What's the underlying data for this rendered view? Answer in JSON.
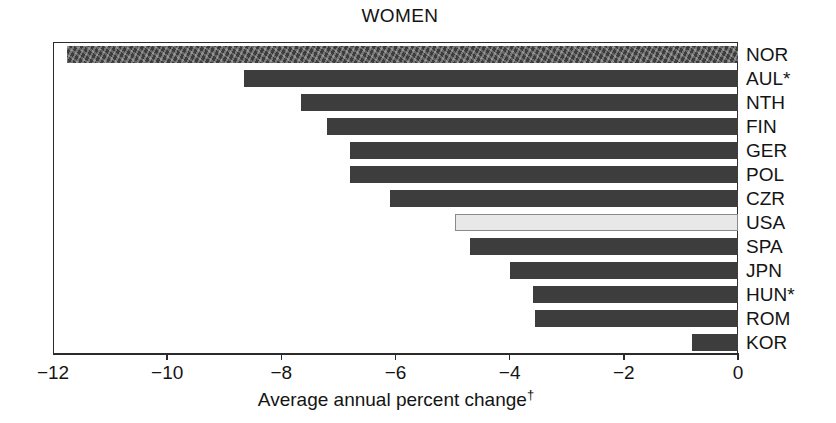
{
  "chart_data": {
    "type": "bar",
    "orientation": "horizontal",
    "title": "WOMEN",
    "xlabel": "Average annual percent change",
    "xlabel_superscript": "†",
    "ylabel": "",
    "xlim": [
      -12,
      0
    ],
    "xticks": [
      -12,
      -10,
      -8,
      -6,
      -4,
      -2,
      0
    ],
    "xtick_labels": [
      "−12",
      "−10",
      "−8",
      "−6",
      "−4",
      "−2",
      "0"
    ],
    "grid": false,
    "legend": null,
    "categories": [
      "NOR",
      "AUL*",
      "NTH",
      "FIN",
      "GER",
      "POL",
      "CZR",
      "USA",
      "SPA",
      "JPN",
      "HUN*",
      "ROM",
      "KOR"
    ],
    "values": [
      -11.75,
      -8.65,
      -7.65,
      -7.2,
      -6.8,
      -6.8,
      -6.1,
      -4.95,
      -4.7,
      -4.0,
      -3.6,
      -3.55,
      -0.8
    ],
    "highlight_category": "USA",
    "bars": [
      {
        "label": "NOR",
        "value": -11.75,
        "style": "mottled"
      },
      {
        "label": "AUL*",
        "value": -8.65,
        "style": "solid"
      },
      {
        "label": "NTH",
        "value": -7.65,
        "style": "solid"
      },
      {
        "label": "FIN",
        "value": -7.2,
        "style": "solid"
      },
      {
        "label": "GER",
        "value": -6.8,
        "style": "solid"
      },
      {
        "label": "POL",
        "value": -6.8,
        "style": "solid"
      },
      {
        "label": "CZR",
        "value": -6.1,
        "style": "solid"
      },
      {
        "label": "USA",
        "value": -4.95,
        "style": "highlight"
      },
      {
        "label": "SPA",
        "value": -4.7,
        "style": "solid"
      },
      {
        "label": "JPN",
        "value": -4.0,
        "style": "solid"
      },
      {
        "label": "HUN*",
        "value": -3.6,
        "style": "solid"
      },
      {
        "label": "ROM",
        "value": -3.55,
        "style": "solid"
      },
      {
        "label": "KOR",
        "value": -0.8,
        "style": "solid"
      }
    ],
    "colors": {
      "bar_fill": "#3d3d3d",
      "highlight_fill": "#e8e8e8",
      "highlight_stroke": "#8a8a8a",
      "axis": "#2b2b2b",
      "text": "#141414",
      "background": "#ffffff"
    }
  }
}
